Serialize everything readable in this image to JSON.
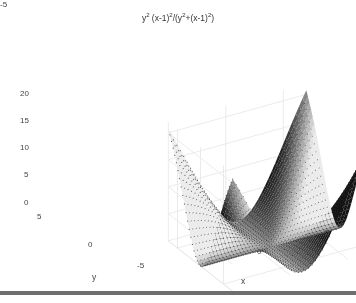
{
  "chart_data": {
    "type": "surface3d",
    "title_parts": {
      "a": "y",
      "a_exp": "2",
      "b": " (x-1)",
      "b_exp": "2",
      "c": "/(y",
      "c_exp": "2",
      "d": "+(x-1)",
      "d_exp": "2",
      "e": ")"
    },
    "function": "z = y^2*(x-1)^2/(y^2+(x-1)^2)",
    "xlabel": "x",
    "ylabel": "y",
    "zlabel": "",
    "xlim": [
      -5,
      7
    ],
    "ylim": [
      -7,
      7
    ],
    "zlim": [
      0,
      22
    ],
    "xticks": [
      "-5",
      "0",
      "5"
    ],
    "yticks": [
      "5",
      "0",
      "-5"
    ],
    "zticks": [
      "0",
      "5",
      "10",
      "15",
      "20"
    ],
    "grid": true,
    "colormap": "gray",
    "grid_points": 40,
    "peak_values": {
      "corner_max": 22,
      "min": 0
    }
  }
}
